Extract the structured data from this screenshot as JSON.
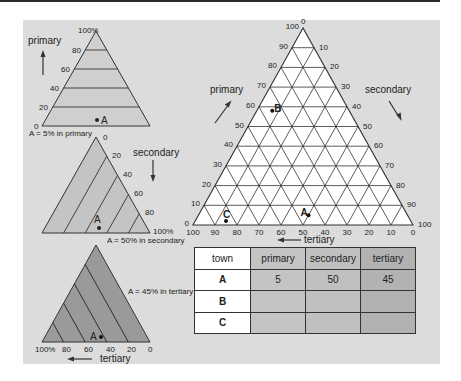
{
  "colors": {
    "panel_bg": "#dcdcdc",
    "tri_primary_fill": "#cfcfcf",
    "tri_secondary_fill": "#c4c4c4",
    "tri_tertiary_fill": "#9a9a9a",
    "big_tri_fill": "#ffffff",
    "line": "#333333"
  },
  "small_triangles": [
    {
      "name": "primary",
      "axis_label": "primary",
      "ticks": [
        "100%",
        "80",
        "60",
        "40",
        "20",
        "0"
      ],
      "point": {
        "label": "A",
        "value": 5
      },
      "caption": "A = 5% in primary"
    },
    {
      "name": "secondary",
      "axis_label": "secondary",
      "ticks": [
        "0",
        "20",
        "40",
        "60",
        "80",
        "100%"
      ],
      "point": {
        "label": "A",
        "value": 50
      },
      "caption": "A = 50% in secondary"
    },
    {
      "name": "tertiary",
      "axis_label": "tertiary",
      "ticks": [
        "100%",
        "80",
        "60",
        "40",
        "20",
        "0"
      ],
      "point": {
        "label": "A",
        "value": 45
      },
      "caption": "A = 45% in tertiary"
    }
  ],
  "ternary": {
    "axes": {
      "primary": {
        "label": "primary",
        "ticks": [
          "0",
          "10",
          "20",
          "30",
          "40",
          "50",
          "60",
          "70",
          "80",
          "90",
          "100"
        ]
      },
      "secondary": {
        "label": "secondary",
        "ticks": [
          "0",
          "10",
          "20",
          "30",
          "40",
          "50",
          "60",
          "70",
          "80",
          "90",
          "100"
        ]
      },
      "tertiary": {
        "label": "tertiary",
        "ticks": [
          "100",
          "90",
          "80",
          "70",
          "60",
          "50",
          "40",
          "30",
          "20",
          "10",
          "0"
        ]
      }
    },
    "points": [
      {
        "label": "A",
        "primary": 5,
        "secondary": 50,
        "tertiary": 45
      },
      {
        "label": "B",
        "primary": 58,
        "secondary": 7,
        "tertiary": 35
      },
      {
        "label": "C",
        "primary": 2,
        "secondary": 14,
        "tertiary": 84
      }
    ]
  },
  "table": {
    "headers": [
      "town",
      "primary",
      "secondary",
      "tertiary"
    ],
    "rows": [
      {
        "town": "A",
        "primary": "5",
        "secondary": "50",
        "tertiary": "45"
      },
      {
        "town": "B",
        "primary": "",
        "secondary": "",
        "tertiary": ""
      },
      {
        "town": "C",
        "primary": "",
        "secondary": "",
        "tertiary": ""
      }
    ]
  },
  "chart_data": {
    "type": "ternary",
    "title": "",
    "axes": [
      "primary",
      "secondary",
      "tertiary"
    ],
    "axis_range": [
      0,
      100
    ],
    "grid": true,
    "grid_step": 10,
    "points": [
      {
        "label": "A",
        "primary": 5,
        "secondary": 50,
        "tertiary": 45
      },
      {
        "label": "B",
        "primary": 58,
        "secondary": 7,
        "tertiary": 35
      },
      {
        "label": "C",
        "primary": 2,
        "secondary": 14,
        "tertiary": 84
      }
    ],
    "annotations": [
      "A = 5% in primary",
      "A = 50% in secondary",
      "A = 45% in tertiary"
    ]
  }
}
